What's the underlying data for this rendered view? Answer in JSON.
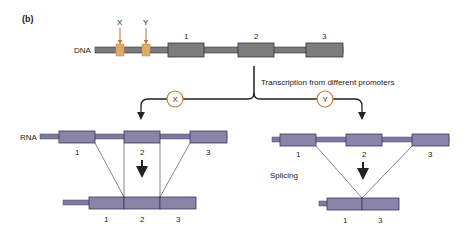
{
  "panel_label": "(b)",
  "colors": {
    "dna_exon": "#7d7d7d",
    "dna_line": "#7a7a7a",
    "promoter": "#e0a868",
    "promoter_arrow": "#c0703a",
    "rna_exon": "#8a84a8",
    "rna_line": "#7f79a0",
    "circle_stroke": "#c8783c",
    "outline": "#333333"
  },
  "dna": {
    "label": "DNA",
    "promoters": [
      {
        "label": "X"
      },
      {
        "label": "Y"
      }
    ],
    "exons": [
      {
        "label": "1"
      },
      {
        "label": "2"
      },
      {
        "label": "3"
      }
    ]
  },
  "transcription_label": "Transcription from different promoters",
  "branches": [
    {
      "promoter": "X"
    },
    {
      "promoter": "Y"
    }
  ],
  "left": {
    "rna_label": "RNA",
    "pre_exons": [
      {
        "label": "1"
      },
      {
        "label": "2"
      },
      {
        "label": "3"
      }
    ],
    "mature_exons": [
      {
        "label": "1"
      },
      {
        "label": "2"
      },
      {
        "label": "3"
      }
    ]
  },
  "right": {
    "splicing_label": "Splicing",
    "pre_exons": [
      {
        "label": "1"
      },
      {
        "label": "2"
      },
      {
        "label": "3"
      }
    ],
    "mature_exons": [
      {
        "label": "1"
      },
      {
        "label": "3"
      }
    ]
  }
}
